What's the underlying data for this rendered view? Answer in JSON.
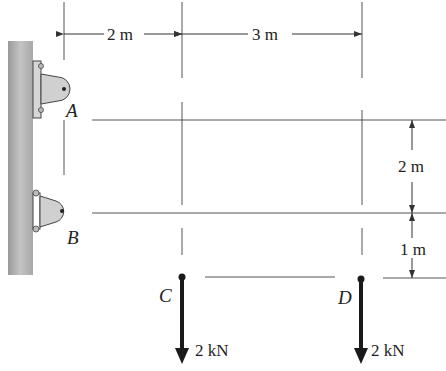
{
  "diagram": {
    "type": "statics-free-body-setup",
    "supports": [
      {
        "label": "A",
        "type": "pin-bracket"
      },
      {
        "label": "B",
        "type": "pin-bracket"
      }
    ],
    "points": [
      {
        "label": "C"
      },
      {
        "label": "D"
      }
    ],
    "dimensions": {
      "horizontal_AC": "2 m",
      "horizontal_CD": "3 m",
      "vertical_AB": "2 m",
      "vertical_B_to_CD": "1 m"
    },
    "loads": [
      {
        "at": "C",
        "label": "2 kN",
        "direction": "down"
      },
      {
        "at": "D",
        "label": "2 kN",
        "direction": "down"
      }
    ],
    "colors": {
      "wall": "#b8b8b8",
      "bracket": "#d0d0d0",
      "lines": "#555555",
      "force": "#1a1a1a"
    }
  }
}
